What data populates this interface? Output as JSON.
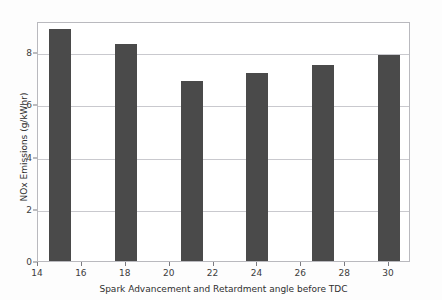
{
  "figure": {
    "background_color": "#fdfdfd",
    "plot_background_color": "#ffffff",
    "border_color": "#b9b9be",
    "bar_color": "#4a4a4a",
    "grid_color": "#c9c9ce",
    "top_ghost_text": "· · · · ·"
  },
  "chart_data": {
    "type": "bar",
    "title": "",
    "xlabel": "Spark Advancement and Retardment angle before TDC",
    "ylabel": "NOx Emissions (g/kWhr)",
    "x": [
      15,
      18,
      21,
      24,
      27,
      30
    ],
    "categories": [
      "15",
      "18",
      "21",
      "24",
      "27",
      "30"
    ],
    "values": [
      8.9,
      8.3,
      6.9,
      7.2,
      7.5,
      7.9
    ],
    "bar_width": 1.0,
    "xlim": [
      14,
      31
    ],
    "ylim": [
      0,
      9.2
    ],
    "xticks": [
      14,
      16,
      18,
      20,
      22,
      24,
      26,
      28,
      30
    ],
    "xticklabels": [
      "14",
      "16",
      "18",
      "20",
      "22",
      "24",
      "26",
      "28",
      "30"
    ],
    "yticks": [
      0,
      2,
      4,
      6,
      8
    ],
    "yticklabels": [
      "0",
      "2",
      "4",
      "6",
      "8"
    ],
    "grid": "horizontal",
    "legend": null,
    "series": [
      {
        "name": "NOx Emissions",
        "values": [
          8.9,
          8.3,
          6.9,
          7.2,
          7.5,
          7.9
        ]
      }
    ]
  }
}
